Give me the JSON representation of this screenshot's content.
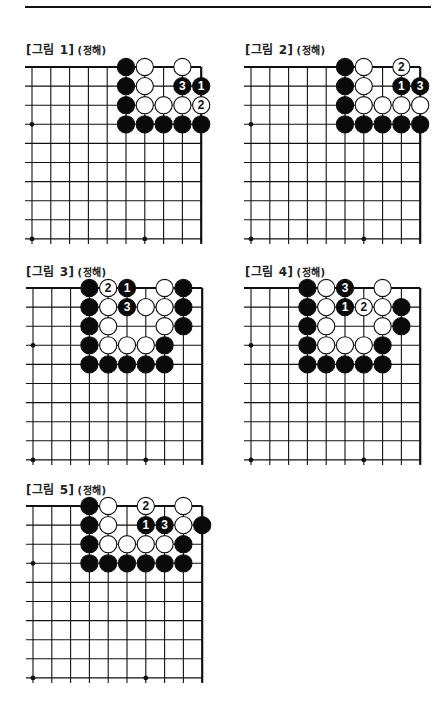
{
  "page": {
    "top_rule": true
  },
  "board_style": {
    "line_color": "#111111",
    "black_stone": "#0a0a0a",
    "white_stone": "#ffffff",
    "stone_outline": "#111111",
    "label_on_black": "#ffffff",
    "label_on_white": "#111111"
  },
  "figures": [
    {
      "title": "[그림 1]",
      "subtitle": "(정해)",
      "pos": {
        "x": 26,
        "y": 40,
        "grid_x": 32,
        "grid_y": 67
      },
      "stones": [
        {
          "c": 5,
          "r": 0,
          "color": "B"
        },
        {
          "c": 6,
          "r": 0,
          "color": "W"
        },
        {
          "c": 8,
          "r": 0,
          "color": "W"
        },
        {
          "c": 5,
          "r": 1,
          "color": "B"
        },
        {
          "c": 6,
          "r": 1,
          "color": "W"
        },
        {
          "c": 8,
          "r": 1,
          "color": "B",
          "label": "3"
        },
        {
          "c": 9,
          "r": 1,
          "color": "B",
          "label": "1"
        },
        {
          "c": 5,
          "r": 2,
          "color": "B"
        },
        {
          "c": 6,
          "r": 2,
          "color": "W"
        },
        {
          "c": 7,
          "r": 2,
          "color": "W"
        },
        {
          "c": 8,
          "r": 2,
          "color": "W"
        },
        {
          "c": 9,
          "r": 2,
          "color": "W",
          "label": "2"
        },
        {
          "c": 5,
          "r": 3,
          "color": "B"
        },
        {
          "c": 6,
          "r": 3,
          "color": "B"
        },
        {
          "c": 7,
          "r": 3,
          "color": "B"
        },
        {
          "c": 8,
          "r": 3,
          "color": "B"
        },
        {
          "c": 9,
          "r": 3,
          "color": "B"
        }
      ]
    },
    {
      "title": "[그림 2]",
      "subtitle": "(정해)",
      "pos": {
        "x": 245,
        "y": 40,
        "grid_x": 251,
        "grid_y": 67
      },
      "stones": [
        {
          "c": 5,
          "r": 0,
          "color": "B"
        },
        {
          "c": 6,
          "r": 0,
          "color": "W"
        },
        {
          "c": 8,
          "r": 0,
          "color": "W",
          "label": "2"
        },
        {
          "c": 5,
          "r": 1,
          "color": "B"
        },
        {
          "c": 6,
          "r": 1,
          "color": "W"
        },
        {
          "c": 8,
          "r": 1,
          "color": "B",
          "label": "1"
        },
        {
          "c": 9,
          "r": 1,
          "color": "B",
          "label": "3"
        },
        {
          "c": 5,
          "r": 2,
          "color": "B"
        },
        {
          "c": 6,
          "r": 2,
          "color": "W"
        },
        {
          "c": 7,
          "r": 2,
          "color": "W"
        },
        {
          "c": 8,
          "r": 2,
          "color": "W"
        },
        {
          "c": 9,
          "r": 2,
          "color": "W"
        },
        {
          "c": 5,
          "r": 3,
          "color": "B"
        },
        {
          "c": 6,
          "r": 3,
          "color": "B"
        },
        {
          "c": 7,
          "r": 3,
          "color": "B"
        },
        {
          "c": 8,
          "r": 3,
          "color": "B"
        },
        {
          "c": 9,
          "r": 3,
          "color": "B"
        }
      ]
    },
    {
      "title": "[그림 3]",
      "subtitle": "(정해)",
      "pos": {
        "x": 26,
        "y": 262,
        "grid_x": 33,
        "grid_y": 288
      },
      "stones": [
        {
          "c": 3,
          "r": 0,
          "color": "B"
        },
        {
          "c": 4,
          "r": 0,
          "color": "W",
          "label": "2"
        },
        {
          "c": 5,
          "r": 0,
          "color": "B",
          "label": "1"
        },
        {
          "c": 7,
          "r": 0,
          "color": "W"
        },
        {
          "c": 8,
          "r": 0,
          "color": "B"
        },
        {
          "c": 3,
          "r": 1,
          "color": "B"
        },
        {
          "c": 4,
          "r": 1,
          "color": "W"
        },
        {
          "c": 5,
          "r": 1,
          "color": "B",
          "label": "3"
        },
        {
          "c": 6,
          "r": 1,
          "color": "W"
        },
        {
          "c": 7,
          "r": 1,
          "color": "W"
        },
        {
          "c": 8,
          "r": 1,
          "color": "B"
        },
        {
          "c": 3,
          "r": 2,
          "color": "B"
        },
        {
          "c": 4,
          "r": 2,
          "color": "W"
        },
        {
          "c": 7,
          "r": 2,
          "color": "W"
        },
        {
          "c": 8,
          "r": 2,
          "color": "B"
        },
        {
          "c": 3,
          "r": 3,
          "color": "B"
        },
        {
          "c": 4,
          "r": 3,
          "color": "W"
        },
        {
          "c": 5,
          "r": 3,
          "color": "W"
        },
        {
          "c": 6,
          "r": 3,
          "color": "W"
        },
        {
          "c": 7,
          "r": 3,
          "color": "B"
        },
        {
          "c": 3,
          "r": 4,
          "color": "B"
        },
        {
          "c": 4,
          "r": 4,
          "color": "B"
        },
        {
          "c": 5,
          "r": 4,
          "color": "B"
        },
        {
          "c": 6,
          "r": 4,
          "color": "B"
        },
        {
          "c": 7,
          "r": 4,
          "color": "B"
        }
      ]
    },
    {
      "title": "[그림 4]",
      "subtitle": "(정해)",
      "pos": {
        "x": 245,
        "y": 262,
        "grid_x": 251,
        "grid_y": 288
      },
      "stones": [
        {
          "c": 3,
          "r": 0,
          "color": "B"
        },
        {
          "c": 4,
          "r": 0,
          "color": "W"
        },
        {
          "c": 5,
          "r": 0,
          "color": "B",
          "label": "3"
        },
        {
          "c": 7,
          "r": 0,
          "color": "W"
        },
        {
          "c": 3,
          "r": 1,
          "color": "B"
        },
        {
          "c": 4,
          "r": 1,
          "color": "W"
        },
        {
          "c": 5,
          "r": 1,
          "color": "B",
          "label": "1"
        },
        {
          "c": 6,
          "r": 1,
          "color": "W",
          "label": "2"
        },
        {
          "c": 7,
          "r": 1,
          "color": "W"
        },
        {
          "c": 8,
          "r": 1,
          "color": "B"
        },
        {
          "c": 3,
          "r": 2,
          "color": "B"
        },
        {
          "c": 4,
          "r": 2,
          "color": "W"
        },
        {
          "c": 7,
          "r": 2,
          "color": "W"
        },
        {
          "c": 8,
          "r": 2,
          "color": "B"
        },
        {
          "c": 3,
          "r": 3,
          "color": "B"
        },
        {
          "c": 4,
          "r": 3,
          "color": "W"
        },
        {
          "c": 5,
          "r": 3,
          "color": "W"
        },
        {
          "c": 6,
          "r": 3,
          "color": "W"
        },
        {
          "c": 7,
          "r": 3,
          "color": "B"
        },
        {
          "c": 3,
          "r": 4,
          "color": "B"
        },
        {
          "c": 4,
          "r": 4,
          "color": "B"
        },
        {
          "c": 5,
          "r": 4,
          "color": "B"
        },
        {
          "c": 6,
          "r": 4,
          "color": "B"
        },
        {
          "c": 7,
          "r": 4,
          "color": "B"
        }
      ]
    },
    {
      "title": "[그림 5]",
      "subtitle": "(정해)",
      "pos": {
        "x": 26,
        "y": 480,
        "grid_x": 33,
        "grid_y": 506
      },
      "stones": [
        {
          "c": 3,
          "r": 0,
          "color": "B"
        },
        {
          "c": 4,
          "r": 0,
          "color": "W"
        },
        {
          "c": 6,
          "r": 0,
          "color": "W",
          "label": "2"
        },
        {
          "c": 8,
          "r": 0,
          "color": "W"
        },
        {
          "c": 3,
          "r": 1,
          "color": "B"
        },
        {
          "c": 4,
          "r": 1,
          "color": "W"
        },
        {
          "c": 6,
          "r": 1,
          "color": "B",
          "label": "1"
        },
        {
          "c": 7,
          "r": 1,
          "color": "B",
          "label": "3"
        },
        {
          "c": 8,
          "r": 1,
          "color": "W"
        },
        {
          "c": 9,
          "r": 1,
          "color": "B"
        },
        {
          "c": 3,
          "r": 2,
          "color": "B"
        },
        {
          "c": 4,
          "r": 2,
          "color": "W"
        },
        {
          "c": 5,
          "r": 2,
          "color": "W"
        },
        {
          "c": 6,
          "r": 2,
          "color": "W"
        },
        {
          "c": 7,
          "r": 2,
          "color": "W"
        },
        {
          "c": 8,
          "r": 2,
          "color": "B"
        },
        {
          "c": 3,
          "r": 3,
          "color": "B"
        },
        {
          "c": 4,
          "r": 3,
          "color": "B"
        },
        {
          "c": 5,
          "r": 3,
          "color": "B"
        },
        {
          "c": 6,
          "r": 3,
          "color": "B"
        },
        {
          "c": 7,
          "r": 3,
          "color": "B"
        },
        {
          "c": 8,
          "r": 3,
          "color": "B"
        }
      ]
    }
  ],
  "grid": {
    "cols": 10,
    "rows": 10,
    "spacing_x": 18.8,
    "spacing_y": 19.1,
    "hoshi": [
      {
        "c": 0,
        "r": 3
      },
      {
        "c": 0,
        "r": 9
      },
      {
        "c": 6,
        "r": 9
      }
    ]
  }
}
